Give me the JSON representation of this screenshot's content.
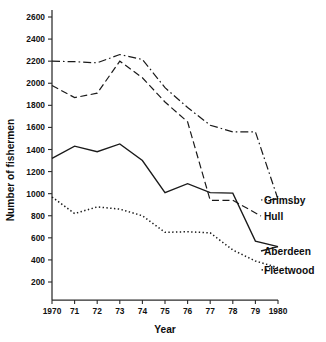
{
  "chart_data": {
    "type": "line",
    "title": "",
    "xlabel": "Year",
    "ylabel": "Number of fishermen",
    "grid": false,
    "legend_position": "right-inline-labels",
    "x": [
      1970,
      1971,
      1972,
      1973,
      1974,
      1975,
      1976,
      1977,
      1978,
      1979,
      1980
    ],
    "xtick_labels": [
      "1970",
      "71",
      "72",
      "73",
      "74",
      "75",
      "76",
      "77",
      "78",
      "79",
      "1980"
    ],
    "ytick_labels": [
      "200",
      "400",
      "600",
      "800",
      "1000",
      "1200",
      "1400",
      "1600",
      "1800",
      "2000",
      "2200",
      "2400",
      "2600"
    ],
    "ytick_values": [
      200,
      400,
      600,
      800,
      1000,
      1200,
      1400,
      1600,
      1800,
      2000,
      2200,
      2400,
      2600
    ],
    "xlim": [
      1970,
      1980
    ],
    "ylim": [
      0,
      2700
    ],
    "series": [
      {
        "name": "Grimsby",
        "linestyle": "dash-dot",
        "color": "#1a1a1a",
        "values": [
          2200,
          2195,
          2185,
          2260,
          2215,
          1960,
          1780,
          1620,
          1560,
          1560,
          950
        ]
      },
      {
        "name": "Hull",
        "linestyle": "dashed",
        "color": "#1a1a1a",
        "values": [
          1980,
          1870,
          1910,
          2200,
          2050,
          1830,
          1650,
          940,
          940,
          null,
          null
        ]
      },
      {
        "name": "Aberdeen",
        "linestyle": "solid",
        "color": "#1a1a1a",
        "values": [
          1320,
          1430,
          1380,
          1450,
          1300,
          1010,
          1090,
          1010,
          1005,
          570,
          520
        ]
      },
      {
        "name": "Fleetwood",
        "linestyle": "dotted",
        "color": "#1a1a1a",
        "values": [
          970,
          820,
          880,
          860,
          800,
          650,
          655,
          645,
          490,
          390,
          330
        ]
      }
    ]
  },
  "axes": {
    "y_title": "Number of fishermen",
    "x_title": "Year"
  },
  "series_labels": {
    "grimsby": "Grimsby",
    "hull": "Hull",
    "aberdeen": "Aberdeen",
    "fleetwood": "Fleetwood"
  }
}
